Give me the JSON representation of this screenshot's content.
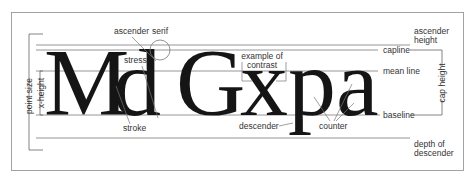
{
  "diagram": {
    "sample_text": "MdGxpa",
    "letters": [
      "M",
      "d",
      "G",
      "x",
      "p",
      "a"
    ],
    "colors": {
      "ink": "#151515",
      "lines": "#8a8a8a",
      "labels": "#333333",
      "frame": "#999999"
    },
    "guide_lines": {
      "ascender": "ascender height",
      "capline": "capline",
      "mean_line": "mean line",
      "baseline": "baseline",
      "descender_depth": "depth of descender"
    },
    "labels": {
      "ascender": "ascender",
      "serif": "serif",
      "stress": "stress",
      "stroke": "stroke",
      "example_of_contrast_1": "example of",
      "example_of_contrast_2": "contrast",
      "descender": "descender",
      "counter": "counter",
      "capline": "capline",
      "mean_line": "mean line",
      "baseline": "baseline",
      "ascender_height_1": "ascender",
      "ascender_height_2": "height",
      "cap_height": "cap height",
      "depth_of_descender_1": "depth of",
      "depth_of_descender_2": "descender",
      "point_size": "point size",
      "x_height": "x-height"
    }
  }
}
